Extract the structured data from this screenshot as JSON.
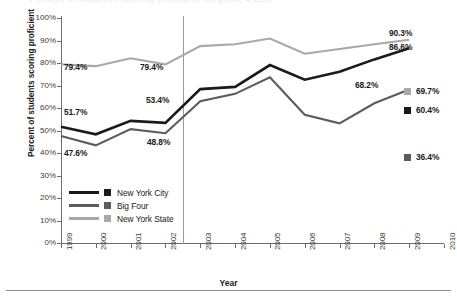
{
  "figure": {
    "title_remnant": "Percent of students scoring proficient on grade 4 ELA",
    "bottom_rule": "horizontal-rule"
  },
  "axes": {
    "ylabel": "Percent of students scoring proficient",
    "xlabel": "Year",
    "yticks": [
      "100%",
      "90%",
      "80%",
      "70%",
      "60%",
      "50%",
      "40%",
      "30%",
      "20%",
      "10%",
      "0%"
    ],
    "xticks": [
      "1999",
      "2000",
      "2001",
      "2002",
      "2003",
      "2004",
      "2005",
      "2006",
      "2007",
      "2008",
      "2009",
      "2010"
    ]
  },
  "legend": {
    "items": [
      {
        "label": "New York City",
        "color": "#1a1a1a"
      },
      {
        "label": "Big Four",
        "color": "#5c5c5c"
      },
      {
        "label": "New York State",
        "color": "#a8a8a8"
      }
    ]
  },
  "annotations": [
    {
      "id": "state-1999",
      "text": "79.4%"
    },
    {
      "id": "state-2002",
      "text": "79.4%"
    },
    {
      "id": "nyc-1999",
      "text": "51.7%"
    },
    {
      "id": "nyc-2002",
      "text": "53.4%"
    },
    {
      "id": "bigfour-1999",
      "text": "47.6%"
    },
    {
      "id": "bigfour-2002",
      "text": "48.8%"
    },
    {
      "id": "state-2009",
      "text": "90.3%"
    },
    {
      "id": "nyc-2009",
      "text": "86.6%"
    },
    {
      "id": "bigfour-2009",
      "text": "68.2%"
    }
  ],
  "year2010_markers": [
    {
      "label": "69.7%",
      "color": "#a8a8a8",
      "series": "New York State"
    },
    {
      "label": "60.4%",
      "color": "#1a1a1a",
      "series": "New York City"
    },
    {
      "label": "36.4%",
      "color": "#5c5c5c",
      "series": "Big Four"
    }
  ],
  "chart_data": {
    "type": "line",
    "title": "Percent of students scoring proficient on grade 4 ELA",
    "xlabel": "Year",
    "ylabel": "Percent of students scoring proficient",
    "x": [
      1999,
      2000,
      2001,
      2002,
      2003,
      2004,
      2005,
      2006,
      2007,
      2008,
      2009,
      2010
    ],
    "ylim": [
      0,
      100
    ],
    "xlim": [
      1999,
      2010
    ],
    "grid": false,
    "legend_position": "inside-lower-left",
    "yticks": [
      0,
      10,
      20,
      30,
      40,
      50,
      60,
      70,
      80,
      90,
      100
    ],
    "series": [
      {
        "name": "New York City",
        "color": "#1a1a1a",
        "values": [
          51.7,
          48.3,
          54.3,
          53.4,
          68.4,
          69.4,
          79.1,
          72.6,
          76.1,
          81.6,
          86.6,
          60.4
        ],
        "labeled_points": {
          "1999": "51.7%",
          "2002": "53.4%",
          "2009": "86.6%",
          "2010": "60.4%"
        }
      },
      {
        "name": "Big Four",
        "color": "#5c5c5c",
        "values": [
          47.6,
          43.4,
          50.6,
          48.8,
          63.0,
          66.3,
          73.6,
          57.0,
          53.2,
          62.1,
          68.2,
          36.4
        ],
        "labeled_points": {
          "1999": "47.6%",
          "2002": "48.8%",
          "2009": "68.2%",
          "2010": "36.4%"
        }
      },
      {
        "name": "New York State",
        "color": "#a8a8a8",
        "values": [
          79.4,
          78.6,
          82.1,
          79.4,
          87.5,
          88.3,
          90.9,
          84.1,
          86.2,
          88.3,
          90.3,
          69.7
        ],
        "labeled_points": {
          "1999": "79.4%",
          "2002": "79.4%",
          "2009": "90.3%",
          "2010": "69.7%"
        }
      }
    ],
    "annotations": [
      {
        "text": "79.4%",
        "x": 1999,
        "series": "New York State"
      },
      {
        "text": "79.4%",
        "x": 2002,
        "series": "New York State"
      },
      {
        "text": "51.7%",
        "x": 1999,
        "series": "New York City"
      },
      {
        "text": "53.4%",
        "x": 2002,
        "series": "New York City"
      },
      {
        "text": "47.6%",
        "x": 1999,
        "series": "Big Four"
      },
      {
        "text": "48.8%",
        "x": 2002,
        "series": "Big Four"
      },
      {
        "text": "90.3%",
        "x": 2009,
        "series": "New York State"
      },
      {
        "text": "86.6%",
        "x": 2009,
        "series": "New York City"
      },
      {
        "text": "68.2%",
        "x": 2009,
        "series": "Big Four"
      }
    ],
    "reference_line": {
      "orientation": "vertical",
      "between": [
        2002,
        2003
      ],
      "color": "#9a9a9a"
    },
    "note": "2010 values are shown as detached square markers at the right edge, not connected to the lines."
  }
}
